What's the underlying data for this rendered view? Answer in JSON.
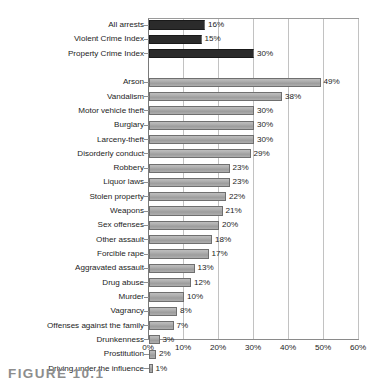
{
  "caption": "FIGURE 10.1",
  "chart_data": {
    "type": "bar",
    "orientation": "horizontal",
    "title": "",
    "xlabel": "",
    "ylabel": "",
    "xlim": [
      0,
      60
    ],
    "xticks": [
      "0%",
      "10%",
      "20%",
      "30%",
      "40%",
      "50%",
      "60%"
    ],
    "xtick_values": [
      0,
      10,
      20,
      30,
      40,
      50,
      60
    ],
    "grid": "vertical",
    "legend": "none",
    "value_suffix": "%",
    "groups": [
      {
        "name": "totals",
        "color": "#2b2b2b",
        "categories": [
          "All arrests",
          "Violent Crime Index",
          "Property Crime Index"
        ],
        "values": [
          16,
          15,
          30
        ],
        "labels": [
          "16%",
          "15%",
          "30%"
        ]
      },
      {
        "name": "offenses",
        "color": "#a6a6a6",
        "categories": [
          "Arson",
          "Vandalism",
          "Motor vehicle theft",
          "Burglary",
          "Larceny-theft",
          "Disorderly conduct",
          "Robbery",
          "Liquor laws",
          "Stolen property",
          "Weapons",
          "Sex offenses",
          "Other assault",
          "Forcible rape",
          "Aggravated assault",
          "Drug abuse",
          "Murder",
          "Vagrancy",
          "Offenses against the family",
          "Drunkenness",
          "Prostitution",
          "Driving under the influence"
        ],
        "values": [
          49,
          38,
          30,
          30,
          30,
          29,
          23,
          23,
          22,
          21,
          20,
          18,
          17,
          13,
          12,
          10,
          8,
          7,
          3,
          2,
          1
        ],
        "labels": [
          "49%",
          "38%",
          "30%",
          "30%",
          "30%",
          "29%",
          "23%",
          "23%",
          "22%",
          "21%",
          "20%",
          "18%",
          "17%",
          "13%",
          "12%",
          "10%",
          "8%",
          "7%",
          "3%",
          "2%",
          "1%"
        ]
      }
    ]
  }
}
